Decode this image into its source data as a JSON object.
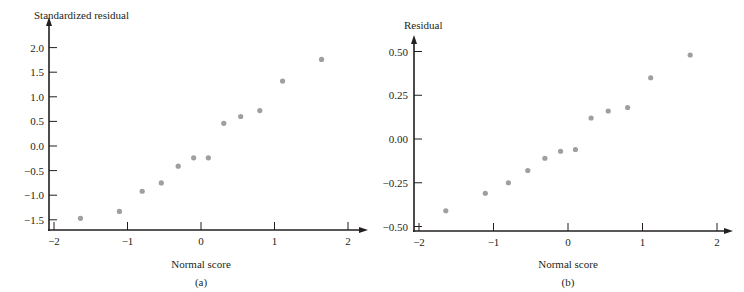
{
  "chart_data": [
    {
      "type": "scatter",
      "panel_label": "(a)",
      "title": "",
      "xlabel": "Normal score",
      "ylabel": "Standardized residual",
      "xlim": [
        -2,
        2.3
      ],
      "ylim": [
        -1.7,
        2.4
      ],
      "xticks": [
        -2,
        -1,
        0,
        1,
        2
      ],
      "xtick_labels": [
        "−2",
        "−1",
        "0",
        "1",
        "2"
      ],
      "yticks": [
        -1.5,
        -1.0,
        -0.5,
        0.0,
        0.5,
        1.0,
        1.5,
        2.0
      ],
      "ytick_labels": [
        "−1.5",
        "−1.0",
        "−0.5",
        "0.0",
        "0.5",
        "1.0",
        "1.5",
        "2.0"
      ],
      "grid": false,
      "point_color": "#9d9fa2",
      "x": [
        -1.64,
        -1.11,
        -0.8,
        -0.54,
        -0.31,
        -0.1,
        0.1,
        0.31,
        0.54,
        0.8,
        1.11,
        1.64
      ],
      "y": [
        -1.47,
        -1.33,
        -0.92,
        -0.75,
        -0.41,
        -0.24,
        -0.24,
        0.46,
        0.6,
        0.72,
        1.32,
        1.76
      ]
    },
    {
      "type": "scatter",
      "panel_label": "(b)",
      "title": "",
      "xlabel": "Normal score",
      "ylabel": "Residual",
      "xlim": [
        -2,
        2.25
      ],
      "ylim": [
        -0.52,
        0.62
      ],
      "xticks": [
        -2,
        -1,
        0,
        1,
        2
      ],
      "xtick_labels": [
        "−2",
        "−1",
        "0",
        "1",
        "2"
      ],
      "yticks": [
        -0.5,
        -0.25,
        0.0,
        0.25,
        0.5
      ],
      "ytick_labels": [
        "−0.50",
        "−0.25",
        "0.00",
        "0.25",
        "0.50"
      ],
      "grid": false,
      "point_color": "#9d9fa2",
      "x": [
        -1.64,
        -1.11,
        -0.8,
        -0.54,
        -0.31,
        -0.1,
        0.1,
        0.31,
        0.54,
        0.8,
        1.11,
        1.64
      ],
      "y": [
        -0.41,
        -0.31,
        -0.25,
        -0.18,
        -0.11,
        -0.07,
        -0.06,
        0.12,
        0.16,
        0.18,
        0.35,
        0.48
      ]
    }
  ]
}
